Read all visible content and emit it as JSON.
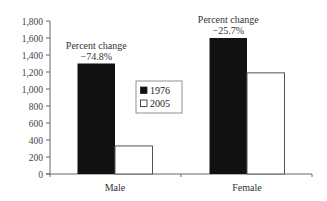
{
  "chart_data": {
    "type": "bar",
    "title": "",
    "xlabel": "",
    "ylabel": "",
    "categories": [
      "Male",
      "Female"
    ],
    "series": [
      {
        "name": "1976",
        "values": [
          1300,
          1600
        ],
        "color": "#111111"
      },
      {
        "name": "2005",
        "values": [
          330,
          1190
        ],
        "color": "#ffffff"
      }
    ],
    "ylim": [
      0,
      1800
    ],
    "yticks": [
      0,
      200,
      400,
      600,
      800,
      1000,
      1200,
      1400,
      1600,
      1800
    ],
    "ytick_labels": [
      "0",
      "200",
      "400",
      "600",
      "800",
      "1,000",
      "1,200",
      "1,400",
      "1,600",
      "1,800"
    ],
    "grid": false,
    "legend_position": "center",
    "annotations": [
      {
        "category": "Male",
        "line1": "Percent change",
        "line2": "−74.8%"
      },
      {
        "category": "Female",
        "line1": "Percent change",
        "line2": "−25.7%"
      }
    ]
  }
}
